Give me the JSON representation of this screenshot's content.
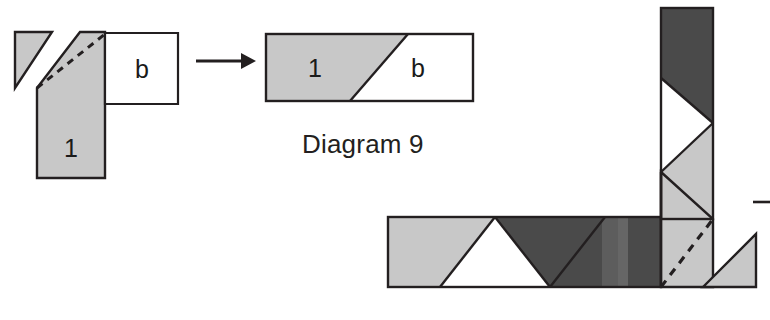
{
  "figure": {
    "caption": "Diagram 9",
    "background_color": "#ffffff",
    "stroke_color": "#231f20",
    "colors": {
      "light_gray": "#c8c8c8",
      "mid_gray": "#b4b4b4",
      "dark_gray": "#4a4a4a",
      "white": "#ffffff",
      "outline": "#231f20",
      "text": "#231f20"
    }
  },
  "left_figure": {
    "name": "before-folding",
    "labels": {
      "piece_one": "1",
      "piece_b": "b"
    },
    "parts": [
      {
        "name": "detached-corner-triangle",
        "fill": "light_gray",
        "points": "15,32 52,32 15,88"
      },
      {
        "name": "main-gray-body",
        "fill": "light_gray",
        "points": "37,88 80,32 105,32 105,178 37,178"
      },
      {
        "name": "white-box-b",
        "fill": "white",
        "points": "105,33 178,33 178,104 105,104"
      }
    ],
    "dashed_fold_line": {
      "name": "fold-crease",
      "points": "37,88 105,34"
    }
  },
  "arrow": {
    "name": "transform-arrow",
    "x1": 196,
    "y1": 61,
    "x2": 248,
    "y2": 61
  },
  "right_result": {
    "name": "after-folding",
    "labels": {
      "piece_one": "1",
      "piece_b": "b"
    },
    "parts": [
      {
        "name": "result-gray-region",
        "fill": "light_gray",
        "points": "266,34 408,34 350,101 266,101"
      },
      {
        "name": "result-white-region",
        "fill": "white",
        "points": "408,34 473,34 473,101 350,101"
      }
    ],
    "outer_rect": {
      "x": 266,
      "y": 34,
      "width": 207,
      "height": 67
    }
  },
  "assembly_figure": {
    "name": "l-shaped-assembly",
    "vertical_column": {
      "name": "vertical-column",
      "x": 661,
      "y": 8,
      "width": 52,
      "height": 211,
      "parts": [
        {
          "name": "column-dark-upper",
          "fill": "dark_gray",
          "points": "661,8 713,8 713,123 661,78"
        },
        {
          "name": "column-white-chevron",
          "fill": "white",
          "points": "661,78 713,123 661,172"
        },
        {
          "name": "column-gray-lower",
          "fill": "light_gray",
          "points": "713,123 713,219 661,172"
        }
      ]
    },
    "horizontal_band": {
      "name": "horizontal-band",
      "x": 388,
      "y": 217,
      "width": 273,
      "height": 70,
      "parts": [
        {
          "name": "band-left-gray",
          "fill": "light_gray",
          "points": "388,217 495,217 440,287 388,287"
        },
        {
          "name": "band-white-triangle",
          "fill": "white",
          "points": "495,217 550,287 440,287"
        },
        {
          "name": "band-dark-region",
          "fill": "dark_gray",
          "points": "495,217 605,217 550,287"
        },
        {
          "name": "band-dark-right",
          "fill": "dark_gray",
          "points": "605,217 661,217 661,287 550,287"
        }
      ]
    },
    "corner_gray_wedge": {
      "name": "corner-gray-wedge",
      "fill": "light_gray",
      "points": "661,172 713,219 713,287 661,287"
    },
    "detached_triangle": {
      "name": "detached-gray-triangle",
      "fill": "light_gray",
      "points": "703,287 756,234 756,287"
    },
    "dashed_fold_line": {
      "name": "assembly-fold-crease",
      "points": "661,287 713,219"
    },
    "edge_tick": {
      "name": "right-edge-tick-mark",
      "x1": 753,
      "y1": 202,
      "x2": 770,
      "y2": 202
    }
  }
}
